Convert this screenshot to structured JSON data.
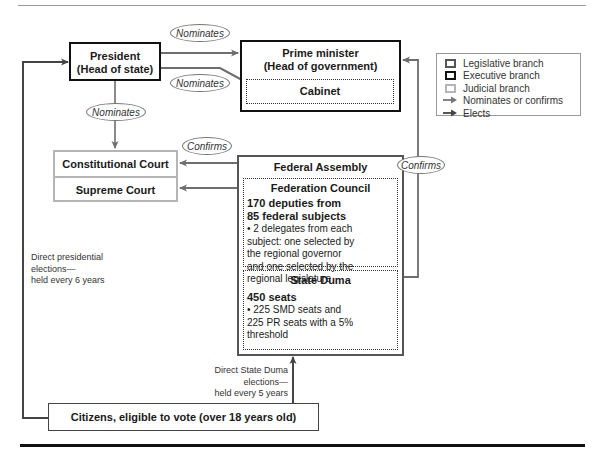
{
  "diagram": {
    "nodes": {
      "president": {
        "line1": "President",
        "line2": "(Head of state)",
        "branch": "executive"
      },
      "prime_minister": {
        "line1": "Prime minister",
        "line2": "(Head of government)",
        "branch": "executive"
      },
      "cabinet": {
        "label": "Cabinet",
        "branch": "executive"
      },
      "constitutional_court": {
        "label": "Constitutional Court",
        "branch": "judicial"
      },
      "supreme_court": {
        "label": "Supreme Court",
        "branch": "judicial"
      },
      "federal_assembly": {
        "label": "Federal Assembly",
        "branch": "legislative"
      },
      "federation_council": {
        "label": "Federation Council",
        "headline": "170 deputies from 85 federal subjects",
        "headline_line1": "170 deputies from",
        "headline_line2": "85 federal subjects",
        "bullet_lines": [
          "• 2 delegates from each",
          "subject: one selected by",
          "the regional governor",
          "and one selected by the",
          "regional legislature"
        ]
      },
      "state_duma": {
        "label": "State Duma",
        "headline": "450 seats",
        "bullet_lines": [
          "• 225 SMD seats and",
          "225 PR seats with a 5%",
          "threshold"
        ]
      },
      "citizens": {
        "label": "Citizens, eligible to vote (over 18 years old)"
      }
    },
    "edge_labels": {
      "president_to_pm": "Nominates",
      "president_to_cabinet": "Nominates",
      "president_to_courts": "Nominates",
      "assembly_to_courts": "Confirms",
      "assembly_to_pm": "Confirms"
    },
    "notes": {
      "presidential_elections": [
        "Direct presidential",
        "elections—",
        "held every 6 years"
      ],
      "duma_elections": [
        "Direct State Duma",
        "elections—",
        "held every 5 years"
      ]
    },
    "legend": {
      "items": [
        {
          "label": "Legislative branch",
          "kind": "box",
          "color": "#555555"
        },
        {
          "label": "Executive branch",
          "kind": "box",
          "color": "#111111"
        },
        {
          "label": "Judicial branch",
          "kind": "box",
          "color": "#b5b5b5"
        },
        {
          "label": "Nominates or confirms",
          "kind": "arrow",
          "color": "#777777"
        },
        {
          "label": "Elects",
          "kind": "arrow",
          "color": "#444444"
        }
      ]
    },
    "colors": {
      "executive": "#111111",
      "legislative": "#555555",
      "judicial": "#b5b5b5",
      "arrow": "#6e6e6e"
    }
  }
}
